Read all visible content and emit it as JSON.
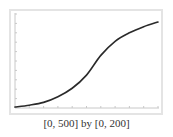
{
  "chart_data": {
    "type": "line",
    "title": "",
    "xlabel": "",
    "ylabel": "",
    "xlim": [
      0,
      500
    ],
    "ylim": [
      0,
      200
    ],
    "x_tick_step": 50,
    "y_tick_step": 20,
    "grid": false,
    "legend": null,
    "series": [
      {
        "name": "curve",
        "color": "#2a2a2a",
        "x": [
          0,
          50,
          100,
          150,
          200,
          250,
          300,
          350,
          400,
          450,
          500
        ],
        "values": [
          2,
          6,
          12,
          24,
          42,
          70,
          112,
          142,
          160,
          173,
          183
        ]
      }
    ],
    "caption": "[0, 500] by [0, 200]"
  },
  "colors": {
    "frame": "#e4e4e4",
    "axis": "#c8c8c8",
    "curve": "#2a2a2a"
  }
}
